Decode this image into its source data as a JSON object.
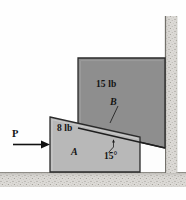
{
  "figure": {
    "labels": {
      "weight_b": "15 lb",
      "body_b": "B",
      "weight_a": "8 lb",
      "body_a": "A",
      "angle": "15°",
      "force_p": "P"
    },
    "colors": {
      "block_b_fill": "#8e8e8e",
      "wedge_a_fill": "#b8b8b8",
      "outline": "#2a2a2a",
      "ground_fill": "#d8d6d2",
      "wall_fill": "#d8d6d2",
      "background": "#fefefe",
      "arrow": "#111111",
      "text": "#141414"
    },
    "geometry": {
      "block_b": {
        "type": "parallelogram-quad",
        "points": "78,58 165,58 165,148 78,128"
      },
      "wedge_a": {
        "type": "quad",
        "points": "50,117 140,137 140,172 50,172"
      },
      "incline_angle_degrees": 15,
      "ground": {
        "x": 0,
        "y": 172,
        "width": 186,
        "height": 16
      },
      "wall": {
        "x": 165,
        "y": 16,
        "width": 12,
        "height": 156
      },
      "gap_region": "140,137 165,148 165,172 140,172",
      "force_arrow": {
        "x1": 13,
        "y1": 144,
        "x2": 50,
        "y2": 144,
        "direction": "right"
      },
      "angle_leader": {
        "x1": 113,
        "y1": 144,
        "x2": 108,
        "y2": 153
      },
      "body_b_leader": {
        "x1": 117,
        "y1": 108,
        "x2": 110,
        "y2": 122
      }
    }
  }
}
